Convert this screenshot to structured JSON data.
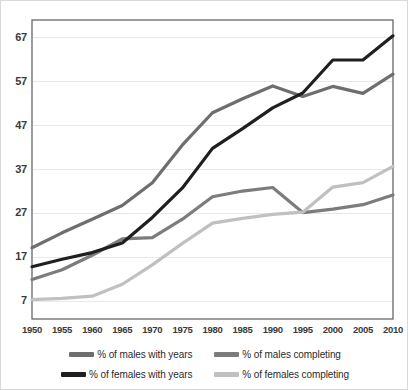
{
  "chart_data": {
    "type": "line",
    "title": "",
    "xlabel": "",
    "ylabel": "",
    "grid": true,
    "legend_position": "bottom",
    "x": [
      1950,
      1955,
      1960,
      1965,
      1970,
      1975,
      1980,
      1985,
      1990,
      1995,
      2000,
      2005,
      2010
    ],
    "categories": [
      "1950",
      "1955",
      "1960",
      "1965",
      "1970",
      "1975",
      "1980",
      "1985",
      "1990",
      "1995",
      "2000",
      "2005",
      "2010"
    ],
    "xtick_labels": [
      "1950",
      "1955",
      "1960",
      "1965",
      "1970",
      "1975",
      "1980",
      "1985",
      "1990",
      "1995",
      "2000",
      "2005",
      "2010"
    ],
    "ytick_labels": [
      "7",
      "17",
      "27",
      "37",
      "47",
      "57",
      "67"
    ],
    "yticks": [
      7,
      17,
      27,
      37,
      47,
      57,
      67
    ],
    "ylim": [
      3,
      71
    ],
    "xlim": [
      1950,
      2010
    ],
    "series": [
      {
        "name": "% of males with years",
        "color": "#6e6e6e",
        "values": [
          19.2,
          22.6,
          25.7,
          28.8,
          34.0,
          42.6,
          49.9,
          53.1,
          56.0,
          53.6,
          55.9,
          54.3,
          58.7
        ]
      },
      {
        "name": "% of males completing",
        "color": "#7c7c7c",
        "values": [
          12.0,
          14.2,
          17.5,
          21.2,
          21.5,
          25.7,
          30.8,
          32.1,
          32.9,
          27.2,
          28.0,
          29.0,
          31.2
        ]
      },
      {
        "name": "% of females with years",
        "color": "#1f1f1f",
        "values": [
          14.9,
          16.6,
          18.1,
          20.3,
          26.1,
          32.8,
          41.8,
          46.3,
          51.0,
          54.4,
          61.9,
          61.9,
          67.4
        ]
      },
      {
        "name": "% of females completing",
        "color": "#c0c0c0",
        "values": [
          7.4,
          7.7,
          8.2,
          10.9,
          15.3,
          20.2,
          24.8,
          25.9,
          26.8,
          27.3,
          33.0,
          34.0,
          37.7
        ]
      }
    ]
  },
  "legend": {
    "items": [
      {
        "label": "% of males with years",
        "color": "#6e6e6e"
      },
      {
        "label": "% of males completing",
        "color": "#7c7c7c"
      },
      {
        "label": "% of females with years",
        "color": "#1f1f1f"
      },
      {
        "label": "% of females completing",
        "color": "#c0c0c0"
      }
    ]
  },
  "colors": {
    "plot_border": "#5a5a5a",
    "gridline": "#e8e8e8",
    "frame_border": "#d8d8d8",
    "background": "#ffffff",
    "tick_text": "#3a3a3a"
  }
}
